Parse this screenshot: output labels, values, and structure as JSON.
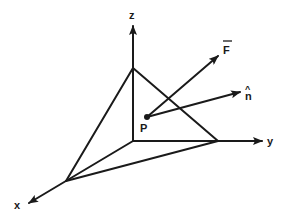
{
  "diagram": {
    "axes": {
      "x_label": "x",
      "y_label": "y",
      "z_label": "z"
    },
    "point_label": "P",
    "force_label": "F",
    "normal_label": "n",
    "normal_hat": "^",
    "colors": {
      "ink": "#1a1a1a",
      "background": "#ffffff"
    }
  }
}
